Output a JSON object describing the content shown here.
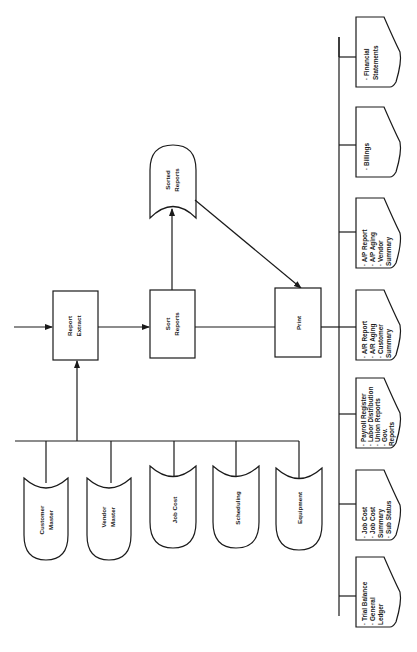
{
  "diagram": {
    "orientation": "rotated 90 degrees counter-clockwise",
    "process_boxes": {
      "report_extract": {
        "line1": "Report",
        "line2": "Extract"
      },
      "sort_reports": {
        "line1": "Sort",
        "line2": "Reports"
      },
      "print": {
        "line1": "Print"
      }
    },
    "storage": {
      "sorted_reports": {
        "line1": "Sorted",
        "line2": "Reports"
      }
    },
    "data_files": [
      {
        "line1": "Customer",
        "line2": "Master"
      },
      {
        "line1": "Vendor",
        "line2": "Master"
      },
      {
        "line1": "Job Cost",
        "line2": ""
      },
      {
        "line1": "Scheduling",
        "line2": ""
      },
      {
        "line1": "Equipment",
        "line2": ""
      }
    ],
    "report_documents": [
      {
        "lines": [
          "· Trial Balance",
          "· General",
          "   Ledger"
        ]
      },
      {
        "lines": [
          "· Job Cost",
          "· Job Cost",
          "   Summary",
          "· Sub Status"
        ]
      },
      {
        "lines": [
          "· Payroll Register",
          "· Labor Distribution",
          "· Union Reports",
          "· Gov.",
          "   Reports"
        ]
      },
      {
        "lines": [
          "· A/R Report",
          "· A/R Aging",
          "· Customer",
          "   Summary"
        ]
      },
      {
        "lines": [
          "· A/P Report",
          "· A/P Aging",
          "· Vendor",
          "   Summary"
        ]
      },
      {
        "lines": [
          "· Billings"
        ]
      },
      {
        "lines": [
          "· Financial",
          "   Statements"
        ]
      }
    ]
  }
}
